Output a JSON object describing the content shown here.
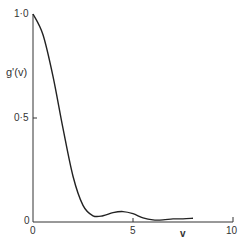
{
  "chart_data": {
    "type": "line",
    "title": "",
    "xlabel": "v",
    "ylabel": "g'(v)",
    "xlim": [
      0,
      10
    ],
    "ylim": [
      0,
      1.0
    ],
    "x_ticks": [
      "0",
      "5",
      "10"
    ],
    "y_ticks": [
      "0",
      "0·5",
      "1·0"
    ],
    "grid": false,
    "series": [
      {
        "name": "g'(v)",
        "x": [
          0,
          0.5,
          1.0,
          1.5,
          2.0,
          2.5,
          3.0,
          3.5,
          4.0,
          4.5,
          5.0,
          5.5,
          6.0,
          6.5,
          7.0,
          7.5,
          8.0
        ],
        "y": [
          1.0,
          0.9,
          0.7,
          0.45,
          0.22,
          0.08,
          0.03,
          0.03,
          0.045,
          0.05,
          0.04,
          0.02,
          0.01,
          0.01,
          0.015,
          0.015,
          0.018
        ]
      }
    ]
  },
  "labels": {
    "ylabel": "g'(v)",
    "xlabel": "v",
    "y_top": "1·0",
    "y_mid": "0·5",
    "y_zero": "0",
    "x_zero": "0",
    "x_mid": "5",
    "x_max": "10"
  }
}
